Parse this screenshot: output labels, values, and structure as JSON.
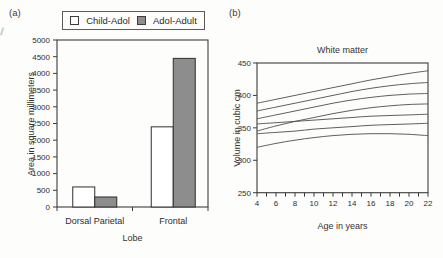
{
  "figure": {
    "panel_a_label": "(a)",
    "panel_b_label": "(b)"
  },
  "chart_data": [
    {
      "type": "bar",
      "panel": "a",
      "title": "",
      "xlabel": "Lobe",
      "ylabel": "Area in square millimeters",
      "categories": [
        "Dorsal Parietal",
        "Frontal"
      ],
      "series": [
        {
          "name": "Child-Adol",
          "fill": "#ffffff",
          "values": [
            600,
            2400
          ]
        },
        {
          "name": "Adol-Adult",
          "fill": "#8d8d8d",
          "values": [
            300,
            4450
          ]
        }
      ],
      "ylim": [
        0,
        5000
      ],
      "ytick_step": 500,
      "legend_position": "top",
      "grid": false
    },
    {
      "type": "line",
      "panel": "b",
      "title": "White matter",
      "xlabel": "Age in years",
      "ylabel": "Volume in cubic cm",
      "xlim": [
        4,
        22
      ],
      "ylim": [
        250,
        450
      ],
      "xticks": [
        4,
        6,
        8,
        10,
        12,
        14,
        16,
        18,
        20,
        22
      ],
      "x_minor_step": 1,
      "yticks": [
        250,
        300,
        350,
        400,
        450
      ],
      "x": [
        4,
        6,
        8,
        10,
        12,
        14,
        16,
        18,
        20,
        22
      ],
      "series": [
        {
          "values": [
            388,
            394,
            400,
            406,
            412,
            418,
            424,
            429,
            434,
            438
          ]
        },
        {
          "values": [
            376,
            382,
            388,
            394,
            400,
            406,
            411,
            415,
            418,
            420
          ]
        },
        {
          "values": [
            364,
            370,
            376,
            382,
            388,
            393,
            397,
            400,
            402,
            403
          ]
        },
        {
          "values": [
            345,
            353,
            360,
            366,
            372,
            377,
            381,
            384,
            386,
            387
          ]
        },
        {
          "values": [
            356,
            358,
            360,
            362,
            364,
            366,
            368,
            369,
            370,
            371
          ]
        },
        {
          "values": [
            341,
            343,
            345,
            348,
            350,
            352,
            354,
            355,
            356,
            357
          ]
        },
        {
          "values": [
            320,
            326,
            331,
            335,
            338,
            340,
            341,
            341,
            340,
            338
          ]
        }
      ],
      "line_color": "#4d4d4d",
      "frame_color": "#3d3d3d",
      "grid": false,
      "legend_position": "none"
    }
  ]
}
